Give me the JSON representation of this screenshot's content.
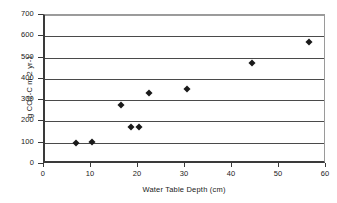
{
  "chart_data": {
    "type": "scatter",
    "title": "",
    "xlabel": "Water Table Depth (cm)",
    "ylabel": "g CO2-C m-2 yr-1",
    "xlim": [
      0,
      60
    ],
    "ylim": [
      0,
      700
    ],
    "xticks": [
      0,
      10,
      20,
      30,
      40,
      50,
      60
    ],
    "yticks": [
      0,
      100,
      200,
      300,
      400,
      500,
      600,
      700
    ],
    "grid": "horizontal",
    "legend": "none",
    "marker": "diamond",
    "marker_color": "#1a1a1a",
    "series": [
      {
        "name": "CO2-C flux",
        "points": [
          {
            "x": 6.6,
            "y": 98
          },
          {
            "x": 10.0,
            "y": 103
          },
          {
            "x": 16.2,
            "y": 277
          },
          {
            "x": 18.3,
            "y": 175
          },
          {
            "x": 20.0,
            "y": 175
          },
          {
            "x": 22.2,
            "y": 333
          },
          {
            "x": 30.2,
            "y": 353
          },
          {
            "x": 44.0,
            "y": 473
          },
          {
            "x": 56.2,
            "y": 572
          }
        ]
      }
    ]
  },
  "axis": {
    "x_tick_labels": [
      "0",
      "10",
      "20",
      "30",
      "40",
      "50",
      "60"
    ],
    "y_tick_labels": [
      "0",
      "100",
      "200",
      "300",
      "400",
      "500",
      "600",
      "700"
    ],
    "x_title": "Water Table Depth (cm)",
    "y_title": "g CO2-C m-2 yr-1"
  },
  "colors": {
    "frame": "#3a3a3a",
    "gridline": "#4a4a4a",
    "marker": "#1a1a1a",
    "background": "#ffffff"
  }
}
